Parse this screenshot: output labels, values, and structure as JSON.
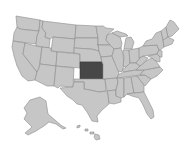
{
  "map": {
    "title": "United States",
    "highlighted_state": "Kansas",
    "colors": {
      "background": "#ffffff",
      "state_fill": "#c6c6c6",
      "state_stroke": "#8c8c8c",
      "highlight_fill": "#474747",
      "highlight_stroke": "#3a3a3a"
    },
    "regions": [
      "Contiguous United States",
      "Alaska",
      "Hawaii"
    ]
  }
}
